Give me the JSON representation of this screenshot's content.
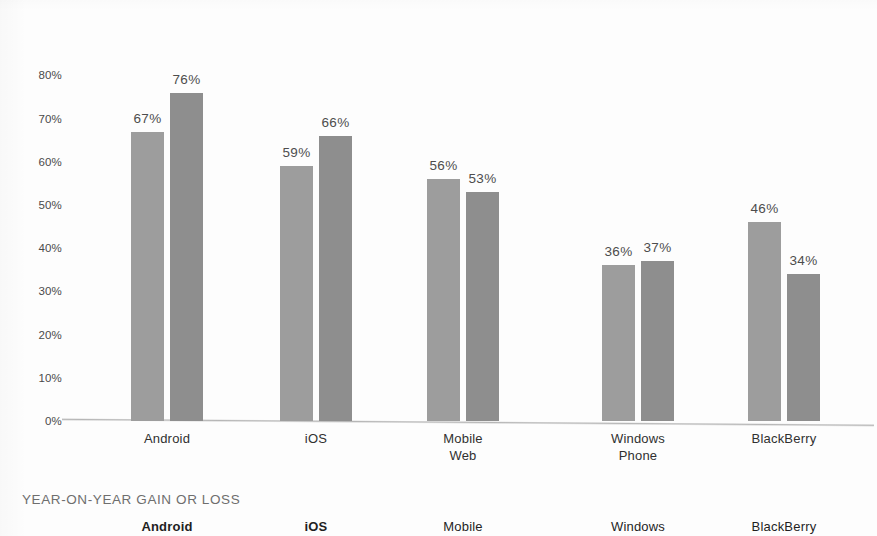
{
  "chart_data": {
    "type": "bar",
    "title": "",
    "subtitle": "",
    "xlabel": "",
    "ylabel": "",
    "ylim": [
      0,
      80
    ],
    "grid": false,
    "legend_position": "none",
    "categories": [
      "Android",
      "iOS",
      "Mobile\nWeb",
      "Windows\nPhone",
      "BlackBerry"
    ],
    "y_ticks": [
      "0%",
      "10%",
      "20%",
      "30%",
      "40%",
      "50%",
      "60%",
      "70%",
      "80%"
    ],
    "y_tick_values": [
      0,
      10,
      20,
      30,
      40,
      50,
      60,
      70,
      80
    ],
    "series": [
      {
        "name": "previous-year",
        "color": "#9d9d9d",
        "values": [
          67,
          59,
          56,
          36,
          46
        ],
        "labels": [
          "67%",
          "59%",
          "56%",
          "36%",
          "46%"
        ]
      },
      {
        "name": "current-year",
        "color": "#8e8e8e",
        "values": [
          76,
          66,
          53,
          37,
          34
        ],
        "labels": [
          "76%",
          "66%",
          "53%",
          "37%",
          "34%"
        ]
      }
    ]
  },
  "lower_band": {
    "title": "YEAR-ON-YEAR GAIN OR LOSS",
    "categories": [
      "Android",
      "iOS",
      "Mobile",
      "Windows",
      "BlackBerry"
    ]
  },
  "colors": {
    "bar_light": "#9d9d9d",
    "bar_dark": "#8e8e8e",
    "axis_text": "#4a4a4a",
    "label_text": "#4d4d4d",
    "band_title": "#6e6e6e",
    "background": "#fdfdfd"
  }
}
